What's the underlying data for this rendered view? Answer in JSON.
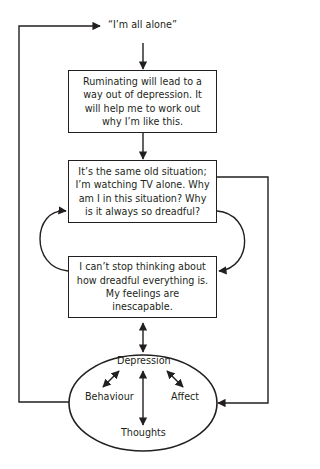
{
  "diagram": {
    "start_label": "“I’m all alone”",
    "boxes": [
      {
        "id": "belief",
        "text": "Ruminating will lead to a way out of depression. It will help me to work out why I’m like this."
      },
      {
        "id": "situation",
        "text": "It’s the same old situation; I’m watching TV alone. Why am I in this situation? Why is it always so dreadful?"
      },
      {
        "id": "rumination",
        "text": "I can’t stop thinking about how dreadful everything is. My feelings are inescapable."
      }
    ],
    "ellipse": {
      "top": "Depression",
      "left": "Behaviour",
      "right": "Affect",
      "bottom": "Thoughts"
    },
    "stroke_color": "#231f20"
  }
}
